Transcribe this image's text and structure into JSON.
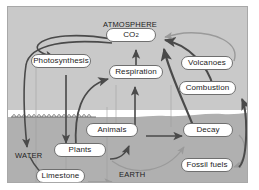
{
  "diagram": {
    "background_color": "#c9c9c9",
    "ground_color": "#b0b0b0",
    "water_band_color": "#ffffff",
    "node_fill": "#ffffff",
    "node_stroke": "#6f6f6f",
    "arrow_dark": "#4a4a4a",
    "arrow_light": "#9a9a9a",
    "regions": [
      {
        "key": "atmosphere",
        "label": "ATMOSPHERE"
      },
      {
        "key": "water",
        "label": "WATER"
      },
      {
        "key": "earth",
        "label": "EARTH"
      }
    ],
    "nodes": [
      {
        "key": "co2",
        "label": "CO",
        "sub": "2",
        "x": 105,
        "y": 27,
        "w": 50,
        "h": 14
      },
      {
        "key": "photosynthesis",
        "label": "Photosynthesis",
        "x": 30,
        "y": 53,
        "w": 60,
        "h": 14
      },
      {
        "key": "respiration",
        "label": "Respiration",
        "x": 108,
        "y": 64,
        "w": 54,
        "h": 14
      },
      {
        "key": "volcanoes",
        "label": "Volcanoes",
        "x": 180,
        "y": 55,
        "w": 52,
        "h": 14
      },
      {
        "key": "combustion",
        "label": "Combustion",
        "x": 178,
        "y": 80,
        "w": 57,
        "h": 14
      },
      {
        "key": "animals",
        "label": "Animals",
        "x": 85,
        "y": 122,
        "w": 52,
        "h": 14
      },
      {
        "key": "decay",
        "label": "Decay",
        "x": 182,
        "y": 122,
        "w": 50,
        "h": 14
      },
      {
        "key": "plants",
        "label": "Plants",
        "x": 53,
        "y": 142,
        "w": 52,
        "h": 14
      },
      {
        "key": "fossil_fuels",
        "label": "Fossil fuels",
        "x": 180,
        "y": 157,
        "w": 52,
        "h": 14
      },
      {
        "key": "limestone",
        "label": "Limestone",
        "x": 35,
        "y": 168,
        "w": 49,
        "h": 14
      }
    ],
    "flows": [
      {
        "from": "co2",
        "to": "photosynthesis",
        "style": "dark"
      },
      {
        "from": "photosynthesis",
        "to": "plants",
        "style": "dark"
      },
      {
        "from": "co2",
        "to": "water",
        "style": "dark"
      },
      {
        "from": "plants",
        "to": "respiration",
        "style": "dark"
      },
      {
        "from": "respiration",
        "to": "co2",
        "style": "dark"
      },
      {
        "from": "animals",
        "to": "respiration",
        "style": "dark"
      },
      {
        "from": "plants",
        "to": "animals",
        "style": "dark"
      },
      {
        "from": "animals",
        "to": "decay",
        "style": "dark"
      },
      {
        "from": "plants",
        "to": "decay",
        "style": "light"
      },
      {
        "from": "decay",
        "to": "co2",
        "style": "dark"
      },
      {
        "from": "decay",
        "to": "fossil_fuels",
        "style": "light"
      },
      {
        "from": "fossil_fuels",
        "to": "combustion",
        "style": "dark"
      },
      {
        "from": "combustion",
        "to": "co2",
        "style": "dark"
      },
      {
        "from": "volcanoes",
        "to": "co2",
        "style": "light"
      },
      {
        "from": "water",
        "to": "limestone",
        "style": "dark"
      },
      {
        "from": "limestone",
        "to": "earth",
        "style": "light"
      }
    ]
  }
}
